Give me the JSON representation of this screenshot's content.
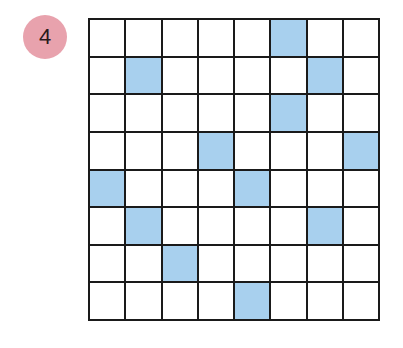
{
  "badge": {
    "label": "4",
    "color": "#e8a2ad"
  },
  "grid": {
    "rows": 8,
    "cols": 8,
    "fill_color": "#a8d0ee",
    "line_color": "#1a1a1a",
    "filled_cells": [
      [
        0,
        5
      ],
      [
        1,
        1
      ],
      [
        1,
        6
      ],
      [
        2,
        5
      ],
      [
        3,
        3
      ],
      [
        3,
        7
      ],
      [
        4,
        0
      ],
      [
        4,
        4
      ],
      [
        5,
        1
      ],
      [
        5,
        6
      ],
      [
        6,
        2
      ],
      [
        7,
        4
      ]
    ]
  }
}
